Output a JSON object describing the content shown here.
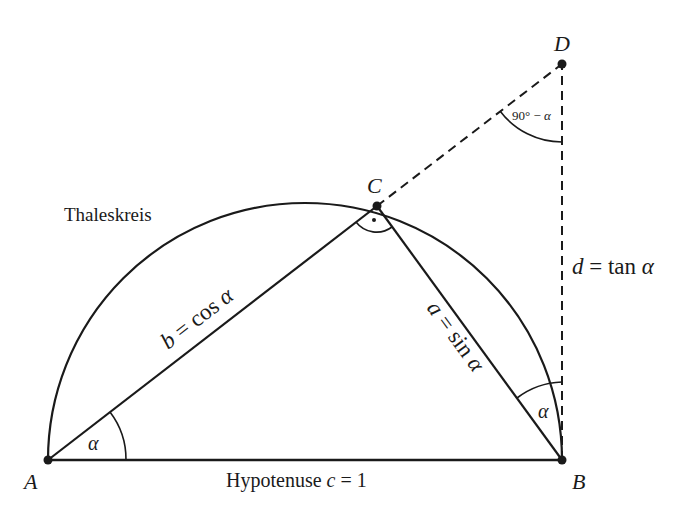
{
  "diagram": {
    "title": "Thaleskreis",
    "points": {
      "A": {
        "label": "A",
        "x": 48,
        "y": 460
      },
      "B": {
        "label": "B",
        "x": 562,
        "y": 460
      },
      "C": {
        "label": "C",
        "x": 377,
        "y": 206
      },
      "D": {
        "label": "D",
        "x": 562,
        "y": 64
      }
    },
    "circle_label": "Thaleskreis",
    "hypotenuse": {
      "word": "Hypotenuse",
      "var": "c",
      "eq": " = 1"
    },
    "side_b": {
      "var": "b",
      "eq": " = cos ",
      "angle": "α"
    },
    "side_a": {
      "var": "a",
      "eq": " = sin ",
      "angle": "α"
    },
    "side_d": {
      "var": "d",
      "eq": " = tan ",
      "angle": "α"
    },
    "angle_A": "α",
    "angle_B": "α",
    "angle_D": {
      "text": "90° − ",
      "angle": "α"
    },
    "right_angle_mark": "·",
    "colors": {
      "line": "#1a1a1a",
      "background": "#ffffff"
    }
  }
}
